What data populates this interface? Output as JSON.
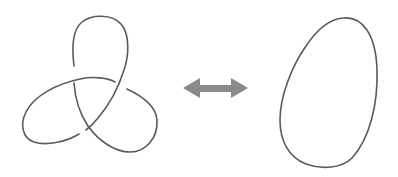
{
  "diagram": {
    "left_figure": {
      "name": "trefoil-knot",
      "label": "Trefoil knot",
      "crossings": 3,
      "stroke_color": "#5a5a5a"
    },
    "connector": {
      "name": "double-headed-arrow",
      "label": "↔",
      "fill_color": "#8a8a8a"
    },
    "right_figure": {
      "name": "unknot-loop",
      "label": "Unknot",
      "crossings": 0,
      "stroke_color": "#5a5a5a"
    },
    "background_color": "#ffffff"
  }
}
